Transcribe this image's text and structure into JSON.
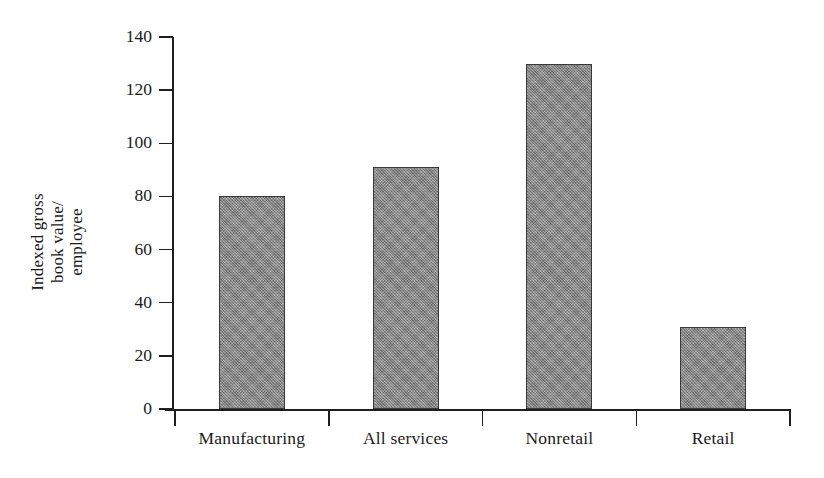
{
  "chart_data": {
    "type": "bar",
    "title": "",
    "subtitle": "",
    "xlabel": "",
    "ylabel": "Indexed gross book value/ employee",
    "ylabel_lines": [
      "Indexed gross",
      "book value/",
      "employee"
    ],
    "categories": [
      "Manufacturing",
      "All services",
      "Nonretail",
      "Retail"
    ],
    "values": [
      80,
      91,
      130,
      31
    ],
    "ylim": [
      0,
      140
    ],
    "yticks": [
      0,
      20,
      40,
      60,
      80,
      100,
      120,
      140
    ],
    "ytick_labels": [
      "0",
      "20",
      "40",
      "60",
      "80",
      "100",
      "120",
      "140"
    ],
    "grid": false,
    "legend": null,
    "legend_position": "none",
    "bar_fill_color": "#8b8b8b",
    "bar_edge_color": "#3a3a3a",
    "axis_color": "#1f1f1f",
    "background_color": "#ffffff"
  }
}
